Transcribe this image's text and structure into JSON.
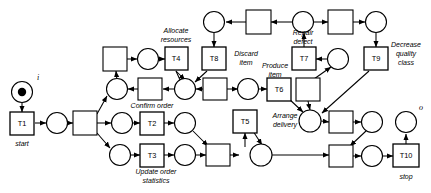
{
  "diagram": {
    "type": "petri-net",
    "io_labels": {
      "input": "i",
      "output": "o"
    },
    "transitions": [
      {
        "id": "T1",
        "label": "T1",
        "caption": "start",
        "x": 22,
        "y": 123
      },
      {
        "id": "T2",
        "label": "T2",
        "caption": "Confirm order",
        "x": 152,
        "y": 123
      },
      {
        "id": "T3",
        "label": "T3",
        "caption": "Update order statistics",
        "x": 152,
        "y": 155
      },
      {
        "id": "T4",
        "label": "T4",
        "caption": "Allocate resources",
        "x": 176,
        "y": 59
      },
      {
        "id": "T5",
        "label": "T5",
        "caption": "Arrange delivery",
        "x": 245,
        "y": 121
      },
      {
        "id": "T6",
        "label": "T6",
        "caption": "Produce item",
        "x": 279,
        "y": 89
      },
      {
        "id": "T7",
        "label": "T7",
        "caption": "Repair defect",
        "x": 304,
        "y": 59
      },
      {
        "id": "T8",
        "label": "T8",
        "caption": "Discard item",
        "x": 213,
        "y": 59
      },
      {
        "id": "T9",
        "label": "T9",
        "caption": "Decrease quality class",
        "x": 376,
        "y": 59
      },
      {
        "id": "T10",
        "label": "T10",
        "caption": "stop",
        "x": 406,
        "y": 156
      }
    ],
    "captions": [
      {
        "text": "start",
        "x": 22,
        "y": 143
      },
      {
        "text": "Confirm order",
        "x": 152,
        "y": 109
      },
      {
        "text": "Update order",
        "x": 155,
        "y": 172
      },
      {
        "text": "statistics",
        "x": 155,
        "y": 181
      },
      {
        "text": "Allocate",
        "x": 176,
        "y": 35
      },
      {
        "text": "resources",
        "x": 176,
        "y": 45
      },
      {
        "text": "Discard",
        "x": 246,
        "y": 56
      },
      {
        "text": "item",
        "x": 246,
        "y": 66
      },
      {
        "text": "Produce",
        "x": 277,
        "y": 67
      },
      {
        "text": "item",
        "x": 277,
        "y": 77
      },
      {
        "text": "Arrange",
        "x": 283,
        "y": 117
      },
      {
        "text": "delivery",
        "x": 283,
        "y": 127
      },
      {
        "text": "Repair",
        "x": 303,
        "y": 36
      },
      {
        "text": "defect",
        "x": 303,
        "y": 46
      },
      {
        "text": "Decrease",
        "x": 405,
        "y": 46
      },
      {
        "text": "quality",
        "x": 405,
        "y": 56
      },
      {
        "text": "class",
        "x": 405,
        "y": 66
      },
      {
        "text": "stop",
        "x": 406,
        "y": 176
      }
    ],
    "places": [
      {
        "id": "p_i",
        "x": 22,
        "y": 92,
        "marked": true
      },
      {
        "id": "p1",
        "x": 57,
        "y": 123,
        "marked": false
      },
      {
        "id": "p2",
        "x": 122,
        "y": 123,
        "marked": false
      },
      {
        "id": "p3",
        "x": 117,
        "y": 89,
        "marked": false
      },
      {
        "id": "p4",
        "x": 120,
        "y": 155,
        "marked": false
      },
      {
        "id": "p5",
        "x": 148,
        "y": 59,
        "marked": false
      },
      {
        "id": "p6",
        "x": 185,
        "y": 123,
        "marked": false
      },
      {
        "id": "p7",
        "x": 185,
        "y": 155,
        "marked": false
      },
      {
        "id": "p8",
        "x": 185,
        "y": 89,
        "marked": false
      },
      {
        "id": "p9",
        "x": 214,
        "y": 22,
        "marked": false
      },
      {
        "id": "p10",
        "x": 248,
        "y": 89,
        "marked": false
      },
      {
        "id": "p11",
        "x": 303,
        "y": 22,
        "marked": false
      },
      {
        "id": "p12",
        "x": 338,
        "y": 59,
        "marked": false
      },
      {
        "id": "p13",
        "x": 376,
        "y": 22,
        "marked": false
      },
      {
        "id": "p14",
        "x": 310,
        "y": 121,
        "marked": false
      },
      {
        "id": "p15",
        "x": 210,
        "y": 155,
        "marked": false
      },
      {
        "id": "p16",
        "x": 372,
        "y": 122,
        "marked": false
      },
      {
        "id": "p17",
        "x": 372,
        "y": 156,
        "marked": false
      },
      {
        "id": "p_o",
        "x": 406,
        "y": 122,
        "marked": false
      }
    ],
    "silent_transitions": [
      {
        "id": "s1",
        "x": 85,
        "y": 123
      },
      {
        "id": "s2",
        "x": 115,
        "y": 59
      },
      {
        "id": "s3",
        "x": 150,
        "y": 89
      },
      {
        "id": "s4",
        "x": 215,
        "y": 89
      },
      {
        "id": "s5",
        "x": 218,
        "y": 155
      },
      {
        "id": "s6",
        "x": 258,
        "y": 22
      },
      {
        "id": "s7",
        "x": 340,
        "y": 22
      },
      {
        "id": "s8",
        "x": 308,
        "y": 89
      },
      {
        "id": "s9",
        "x": 341,
        "y": 122
      },
      {
        "id": "s10",
        "x": 341,
        "y": 156
      }
    ]
  }
}
